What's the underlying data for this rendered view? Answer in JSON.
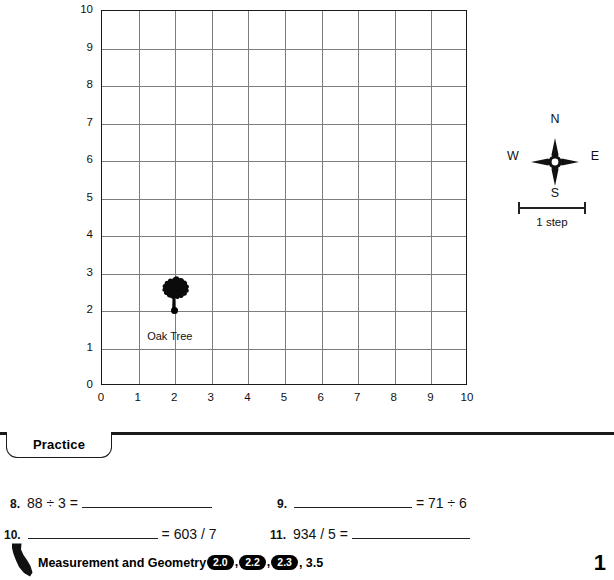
{
  "chart_data": {
    "type": "scatter",
    "title": "",
    "xlabel": "",
    "ylabel": "",
    "xlim": [
      0,
      10
    ],
    "ylim": [
      0,
      10
    ],
    "x_ticks": [
      "0",
      "1",
      "2",
      "3",
      "4",
      "5",
      "6",
      "7",
      "8",
      "9",
      "10"
    ],
    "y_ticks": [
      "0",
      "1",
      "2",
      "3",
      "4",
      "5",
      "6",
      "7",
      "8",
      "9",
      "10"
    ],
    "grid": true,
    "grid_step": 1,
    "legend": "none",
    "points": [
      {
        "label": "Oak Tree",
        "x": 2,
        "y": 2,
        "marker": "dot-with-tree-icon"
      }
    ]
  },
  "map": {
    "oak_tree_label": "Oak Tree"
  },
  "compass": {
    "north": "N",
    "south": "S",
    "east": "E",
    "west": "W",
    "icon": "compass-star-icon"
  },
  "scale": {
    "label": "1 step"
  },
  "practice": {
    "tab_label": "Practice",
    "problems": [
      {
        "number": "8.",
        "pre": "88 ÷ 3 = ",
        "blank": true,
        "post": ""
      },
      {
        "number": "9.",
        "pre": "",
        "blank": true,
        "post": " = 71 ÷ 6"
      },
      {
        "number": "10.",
        "pre": "",
        "blank": true,
        "post": " = 603 / 7"
      },
      {
        "number": "11.",
        "pre": "934 / 5 = ",
        "blank": true,
        "post": ""
      }
    ]
  },
  "footer": {
    "state_icon": "california-state-icon",
    "standards_prefix": "Measurement and Geometry ",
    "badges": [
      "2.0",
      "2.2",
      "2.3"
    ],
    "standards_suffix": ", 3.5",
    "page_number": "1"
  }
}
